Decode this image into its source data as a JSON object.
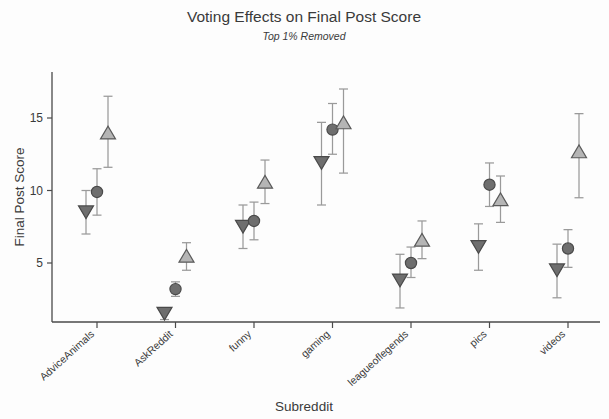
{
  "chart_data": {
    "type": "scatter",
    "title": "Voting Effects on Final Post Score",
    "subtitle": "Top 1% Removed",
    "xlabel": "Subreddit",
    "ylabel": "Final Post Score",
    "categories": [
      "AdviceAnimals",
      "AskReddit",
      "funny",
      "gaming",
      "leagueoflegends",
      "pics",
      "videos"
    ],
    "ylim": [
      0,
      17.3
    ],
    "yticks": [
      5,
      10,
      15
    ],
    "ytick_labels": [
      "5",
      "10",
      "15"
    ],
    "grid": false,
    "legend": "none",
    "series": [
      {
        "name": "downvoted",
        "marker": "triangle-down",
        "fill": "#6e6e6e",
        "stroke": "#4a4a4a",
        "errorbar_color": "#9a9a9a",
        "values": [
          8.5,
          1.5,
          7.5,
          11.9,
          3.8,
          6.1,
          4.5
        ],
        "err_low": [
          7.0,
          1.1,
          6.0,
          9.0,
          1.9,
          4.5,
          2.6
        ],
        "err_high": [
          10.0,
          1.9,
          9.0,
          14.7,
          5.6,
          7.7,
          6.3
        ]
      },
      {
        "name": "no-vote",
        "marker": "circle",
        "fill": "#6e6e6e",
        "stroke": "#4a4a4a",
        "errorbar_color": "#9a9a9a",
        "values": [
          9.9,
          3.2,
          7.9,
          14.2,
          5.0,
          10.4,
          6.0
        ],
        "err_low": [
          8.3,
          2.7,
          6.6,
          12.5,
          4.0,
          8.9,
          4.7
        ],
        "err_high": [
          11.5,
          3.7,
          9.2,
          16.0,
          6.1,
          11.9,
          7.3
        ]
      },
      {
        "name": "upvoted",
        "marker": "triangle-up",
        "fill": "#b5b5b5",
        "stroke": "#5a5a5a",
        "errorbar_color": "#9a9a9a",
        "values": [
          14.0,
          5.5,
          10.6,
          14.7,
          6.6,
          9.4,
          12.7
        ],
        "err_low": [
          11.6,
          4.5,
          9.1,
          11.2,
          5.3,
          7.8,
          9.5
        ],
        "err_high": [
          16.5,
          6.4,
          12.1,
          17.0,
          7.9,
          11.0,
          15.3
        ]
      }
    ]
  },
  "colors": {
    "axis": "#4a4a4a",
    "text": "#3a3a3a",
    "dark_marker": "#6e6e6e",
    "light_marker": "#b5b5b5",
    "errorbar": "#9a9a9a",
    "background": "#fdfdfd"
  }
}
